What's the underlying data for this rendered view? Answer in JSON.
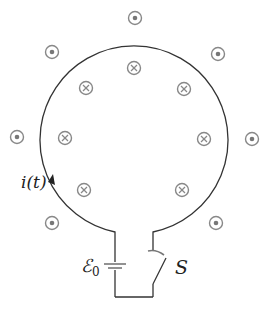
{
  "diagram": {
    "labels": {
      "current": "i(t)",
      "emf": "ℰ",
      "emf_subscript": "0",
      "switch": "S"
    },
    "field_out_of_page": [
      {
        "x": 135,
        "y": 18
      },
      {
        "x": 52,
        "y": 52
      },
      {
        "x": 218,
        "y": 54
      },
      {
        "x": 17,
        "y": 137
      },
      {
        "x": 252,
        "y": 139
      },
      {
        "x": 52,
        "y": 223
      },
      {
        "x": 216,
        "y": 223
      }
    ],
    "field_into_page": [
      {
        "x": 134,
        "y": 68
      },
      {
        "x": 86,
        "y": 88
      },
      {
        "x": 184,
        "y": 89
      },
      {
        "x": 65,
        "y": 138
      },
      {
        "x": 204,
        "y": 139
      },
      {
        "x": 84,
        "y": 190
      },
      {
        "x": 182,
        "y": 190
      }
    ],
    "colors": {
      "wire": "#333333",
      "field_symbol": "#888888"
    }
  }
}
